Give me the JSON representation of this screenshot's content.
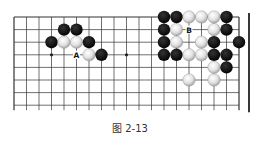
{
  "figure": {
    "caption": "图 2-13",
    "board": {
      "columns": 19,
      "rows": 8,
      "origin_x": 14,
      "origin_y": 17,
      "spacing_x": 12.5,
      "spacing_y": 12.6,
      "line_color": "#333333",
      "edge_line_color": "#222222",
      "star_points": [
        [
          3,
          3
        ],
        [
          9,
          3
        ]
      ],
      "stones": [
        {
          "color": "black",
          "col": 4,
          "row": 1
        },
        {
          "color": "black",
          "col": 5,
          "row": 1
        },
        {
          "color": "black",
          "col": 3,
          "row": 2
        },
        {
          "color": "white",
          "col": 4,
          "row": 2
        },
        {
          "color": "white",
          "col": 5,
          "row": 2
        },
        {
          "color": "black",
          "col": 6,
          "row": 2
        },
        {
          "color": "white",
          "col": 6,
          "row": 3
        },
        {
          "color": "black",
          "col": 7,
          "row": 3
        },
        {
          "color": "black",
          "col": 12,
          "row": 0
        },
        {
          "color": "black",
          "col": 13,
          "row": 0
        },
        {
          "color": "white",
          "col": 14,
          "row": 0
        },
        {
          "color": "white",
          "col": 15,
          "row": 0
        },
        {
          "color": "white",
          "col": 16,
          "row": 0
        },
        {
          "color": "black",
          "col": 17,
          "row": 0
        },
        {
          "color": "black",
          "col": 12,
          "row": 1
        },
        {
          "color": "white",
          "col": 13,
          "row": 1
        },
        {
          "color": "white",
          "col": 16,
          "row": 1
        },
        {
          "color": "black",
          "col": 17,
          "row": 1
        },
        {
          "color": "black",
          "col": 12,
          "row": 2
        },
        {
          "color": "white",
          "col": 13,
          "row": 2
        },
        {
          "color": "white",
          "col": 15,
          "row": 2
        },
        {
          "color": "black",
          "col": 16,
          "row": 2
        },
        {
          "color": "black",
          "col": 18,
          "row": 2
        },
        {
          "color": "black",
          "col": 12,
          "row": 3
        },
        {
          "color": "black",
          "col": 13,
          "row": 3
        },
        {
          "color": "white",
          "col": 14,
          "row": 3
        },
        {
          "color": "white",
          "col": 15,
          "row": 3
        },
        {
          "color": "black",
          "col": 16,
          "row": 3
        },
        {
          "color": "black",
          "col": 17,
          "row": 3
        },
        {
          "color": "white",
          "col": 16,
          "row": 4
        },
        {
          "color": "black",
          "col": 17,
          "row": 4
        },
        {
          "color": "white",
          "col": 14,
          "row": 5
        },
        {
          "color": "white",
          "col": 16,
          "row": 5
        }
      ],
      "labels": [
        {
          "text": "A",
          "col": 5,
          "row": 3
        },
        {
          "text": "B",
          "col": 14,
          "row": 1
        }
      ]
    }
  }
}
